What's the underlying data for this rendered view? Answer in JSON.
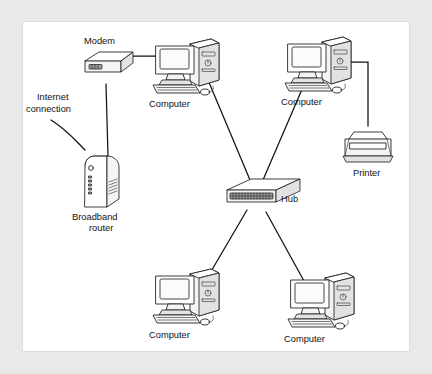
{
  "figure": {
    "background_color": "#e9e9e9",
    "panel_color": "#ffffff",
    "line_color": "#111111"
  },
  "labels": {
    "modem": "Modem",
    "internet_connection": "Internet\nconnection",
    "internet_connection_line1": "Internet",
    "internet_connection_line2": "connection",
    "broadband_router_line1": "Broadband",
    "broadband_router_line2": "router",
    "hub": "Hub",
    "printer": "Printer",
    "computer_top_left": "Computer",
    "computer_top_right": "Computer",
    "computer_bottom_left": "Computer",
    "computer_bottom_right": "Computer"
  },
  "nodes": [
    {
      "id": "modem",
      "label": "Modem",
      "type": "modem",
      "x": 113,
      "y": 57
    },
    {
      "id": "broadband-router",
      "label": "Broadband router",
      "type": "router",
      "x": 104,
      "y": 155
    },
    {
      "id": "computer-top-left",
      "label": "Computer",
      "type": "computer",
      "x": 178,
      "y": 60
    },
    {
      "id": "computer-top-right",
      "label": "Computer",
      "type": "computer",
      "x": 312,
      "y": 58
    },
    {
      "id": "hub",
      "label": "Hub",
      "type": "hub",
      "x": 243,
      "y": 175
    },
    {
      "id": "printer",
      "label": "Printer",
      "type": "printer",
      "x": 368,
      "y": 133
    },
    {
      "id": "computer-bottom-left",
      "label": "Computer",
      "type": "computer",
      "x": 180,
      "y": 289
    },
    {
      "id": "computer-bottom-right",
      "label": "Computer",
      "type": "computer",
      "x": 315,
      "y": 293
    }
  ],
  "connections": [
    {
      "from": "internet",
      "to": "broadband-router",
      "style": "curved"
    },
    {
      "from": "modem",
      "to": "broadband-router",
      "style": "straight"
    },
    {
      "from": "modem",
      "to": "computer-top-left",
      "style": "straight"
    },
    {
      "from": "computer-top-left",
      "to": "hub",
      "style": "straight"
    },
    {
      "from": "computer-top-right",
      "to": "hub",
      "style": "straight"
    },
    {
      "from": "computer-top-right",
      "to": "printer",
      "style": "elbow"
    },
    {
      "from": "hub",
      "to": "computer-bottom-left",
      "style": "straight"
    },
    {
      "from": "hub",
      "to": "computer-bottom-right",
      "style": "straight"
    }
  ]
}
